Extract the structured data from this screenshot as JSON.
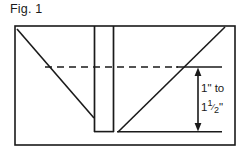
{
  "figure": {
    "caption": "Fig. 1",
    "background_color": "#ffffff",
    "line_color": "#1a1a1a",
    "text_color": "#1a1a1a"
  },
  "dimension_annotation": {
    "line1": "1\" to",
    "line2_whole": "1",
    "line2_numerator": "1",
    "line2_denominator": "2",
    "line2_unit": "\"",
    "full_text": "1\" to 1 1/2\"",
    "arrow_type": "double-headed-vertical"
  },
  "geometry": {
    "type": "line-drawing",
    "description": "Cross-section diagram of a V-shaped trough with a central vertical slot; vertical double-headed dimension arrow at right spans from a horizontal reference line down to the base line.",
    "outer_rectangle": {
      "x1": 15,
      "y1": 26,
      "x2": 235,
      "y2": 145
    },
    "left_diagonal": {
      "x1": 17,
      "y1": 29,
      "x2": 94,
      "y2": 118
    },
    "right_diagonal": {
      "x1": 225,
      "y1": 27,
      "x2": 118,
      "y2": 132
    },
    "slot_left_vertical": {
      "x1": 94,
      "y1": 26,
      "x2": 94,
      "y2": 132
    },
    "slot_right_vertical": {
      "x1": 113,
      "y1": 26,
      "x2": 113,
      "y2": 132
    },
    "slot_bottom": {
      "x1": 94,
      "y1": 132,
      "x2": 113,
      "y2": 132
    },
    "dashed_reference_line": {
      "x1": 45,
      "y1": 67,
      "x2": 177,
      "y2": 67
    },
    "solid_reference_line": {
      "x1": 177,
      "y1": 67,
      "x2": 222,
      "y2": 67
    },
    "base_line": {
      "x1": 118,
      "y1": 132,
      "x2": 222,
      "y2": 132
    },
    "dimension_arrow": {
      "x": 198,
      "y_top": 68,
      "y_bottom": 131
    }
  }
}
